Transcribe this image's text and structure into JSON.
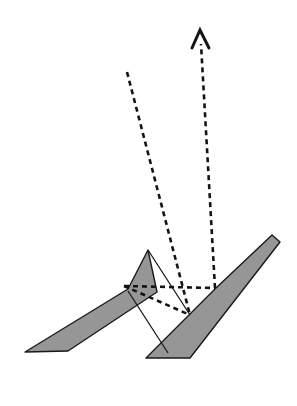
{
  "figure": {
    "width": 297,
    "height": 406,
    "background_color": "#ffffff"
  },
  "colors": {
    "blade_fill": "#969696",
    "blade_stroke": "#1a1a1a",
    "dashed_stroke": "#141414",
    "solid_stroke": "#1a1a1a",
    "arrow_color": "#141414",
    "background": "#ffffff"
  },
  "strokes": {
    "blade_outline_width": 1.4,
    "solid_line_width": 1.3,
    "dashed_line_width": 2.6,
    "dash_pattern": "5,4",
    "arrow_head_width": 3.0
  },
  "shapes": {
    "left_blade": {
      "name": "left-blade",
      "points": "148,250 128,289 25,352 68,351 157,292",
      "fill": "#969696"
    },
    "right_blade": {
      "name": "right-blade",
      "points": "272,235 216,288 146,358 190,358 280,242",
      "fill": "#969696"
    }
  },
  "solid_lines": [
    {
      "name": "connector-upper",
      "x1": 148,
      "y1": 250,
      "x2": 190,
      "y2": 315
    },
    {
      "name": "connector-lower",
      "x1": 128,
      "y1": 291,
      "x2": 168,
      "y2": 353
    }
  ],
  "dashed_rays": [
    {
      "name": "incident-ray",
      "x1": 127,
      "y1": 72,
      "x2": 190,
      "y2": 315
    },
    {
      "name": "reflected-ray-to-left-vertex",
      "x1": 124,
      "y1": 286,
      "x2": 215,
      "y2": 288
    },
    {
      "name": "reflected-ray-to-lower-vertex",
      "x1": 124,
      "y1": 286,
      "x2": 190,
      "y2": 315
    }
  ],
  "arrow": {
    "name": "exit-arrow",
    "shaft_start_x": 215,
    "shaft_start_y": 288,
    "shaft_end_x": 201,
    "shaft_end_y": 44,
    "tip_x": 200,
    "tip_y": 30,
    "head_left_x": 192,
    "head_left_y": 48,
    "head_right_x": 209,
    "head_right_y": 48,
    "direction": "up"
  },
  "vertices": [
    {
      "name": "left-blade-tip",
      "x": 148,
      "y": 250
    },
    {
      "name": "right-blade-tip",
      "x": 272,
      "y": 235
    },
    {
      "name": "left-fan-vertex",
      "x": 124,
      "y": 286
    },
    {
      "name": "right-junction-vertex",
      "x": 215,
      "y": 288
    },
    {
      "name": "lower-reflection-vertex",
      "x": 190,
      "y": 315
    }
  ]
}
